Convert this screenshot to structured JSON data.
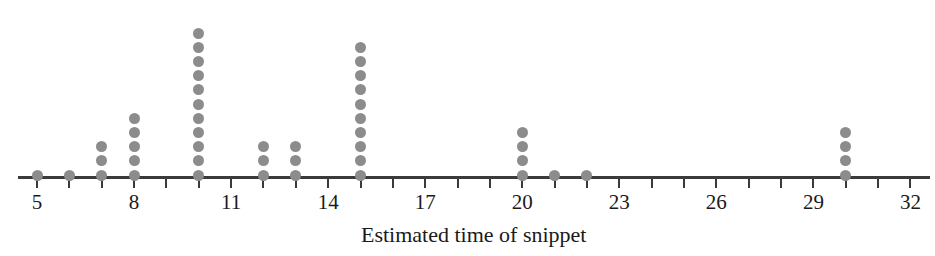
{
  "chart_data": {
    "type": "scatter",
    "plot_style": "dot-plot",
    "title": "",
    "xlabel": "Estimated time of snippet",
    "ylabel": "",
    "xlim": [
      4.4,
      32.6
    ],
    "grid": false,
    "legend": null,
    "x_tick_step": 1,
    "x_label_step": 3,
    "x_tick_values": [
      5,
      6,
      7,
      8,
      9,
      10,
      11,
      12,
      13,
      14,
      15,
      16,
      17,
      18,
      19,
      20,
      21,
      22,
      23,
      24,
      25,
      26,
      27,
      28,
      29,
      30,
      31,
      32
    ],
    "x_tick_labels": [
      "5",
      "",
      "",
      "8",
      "",
      "",
      "11",
      "",
      "",
      "14",
      "",
      "",
      "17",
      "",
      "",
      "20",
      "",
      "",
      "23",
      "",
      "",
      "26",
      "",
      "",
      "29",
      "",
      "",
      "32"
    ],
    "labeled_ticks": [
      {
        "value": 5,
        "label": "5"
      },
      {
        "value": 8,
        "label": "8"
      },
      {
        "value": 11,
        "label": "11"
      },
      {
        "value": 14,
        "label": "14"
      },
      {
        "value": 17,
        "label": "17"
      },
      {
        "value": 20,
        "label": "20"
      },
      {
        "value": 23,
        "label": "23"
      },
      {
        "value": 26,
        "label": "26"
      },
      {
        "value": 29,
        "label": "29"
      },
      {
        "value": 32,
        "label": "32"
      }
    ],
    "categories": [
      5,
      6,
      7,
      8,
      10,
      12,
      13,
      15,
      20,
      21,
      22,
      30
    ],
    "values": [
      1,
      1,
      3,
      5,
      11,
      3,
      3,
      10,
      4,
      1,
      1,
      4
    ],
    "points": [
      {
        "x": 5,
        "count": 1
      },
      {
        "x": 6,
        "count": 1
      },
      {
        "x": 7,
        "count": 3
      },
      {
        "x": 8,
        "count": 5
      },
      {
        "x": 10,
        "count": 11
      },
      {
        "x": 12,
        "count": 3
      },
      {
        "x": 13,
        "count": 3
      },
      {
        "x": 15,
        "count": 10
      },
      {
        "x": 20,
        "count": 4
      },
      {
        "x": 21,
        "count": 1
      },
      {
        "x": 22,
        "count": 1
      },
      {
        "x": 30,
        "count": 4
      }
    ],
    "total_observations": 47,
    "dot_color": "#8c8c8c",
    "axis_color": "#3a3a3a"
  },
  "axis": {
    "title": "Estimated time of snippet"
  }
}
